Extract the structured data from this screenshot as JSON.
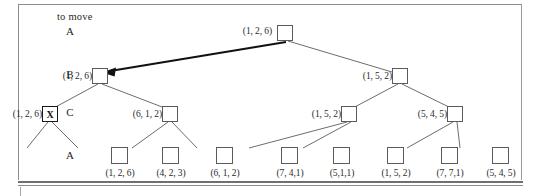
{
  "figure": {
    "header_note": "to move",
    "row_labels": [
      "A",
      "B",
      "C",
      "A"
    ],
    "marked_node_glyph": "X"
  },
  "tree": {
    "root": {
      "label": "(1, 2, 6)",
      "row": "A"
    },
    "level_b": [
      {
        "label": "(1, 2, 6)"
      },
      {
        "label": "(1, 5, 2)"
      }
    ],
    "level_c": [
      {
        "label": "(1, 2, 6)",
        "marked": "X"
      },
      {
        "label": "(6, 1, 2)"
      },
      {
        "label": "(1, 5, 2)"
      },
      {
        "label": "(5, 4, 5)"
      }
    ],
    "leaves": [
      {
        "label": "(1, 2, 6)"
      },
      {
        "label": "(4, 2, 3)"
      },
      {
        "label": "(6, 1, 2)"
      },
      {
        "label": "(7, 4,1)"
      },
      {
        "label": "(5,1,1)"
      },
      {
        "label": "(1, 5, 2)"
      },
      {
        "label": "(7, 7,1)"
      },
      {
        "label": "(5, 4, 5)"
      }
    ]
  },
  "colors": {
    "line": "#5b5b5b",
    "highlight_arrow": "#111111",
    "text": "#2b2b2b",
    "frame": "#8d8d8d"
  }
}
